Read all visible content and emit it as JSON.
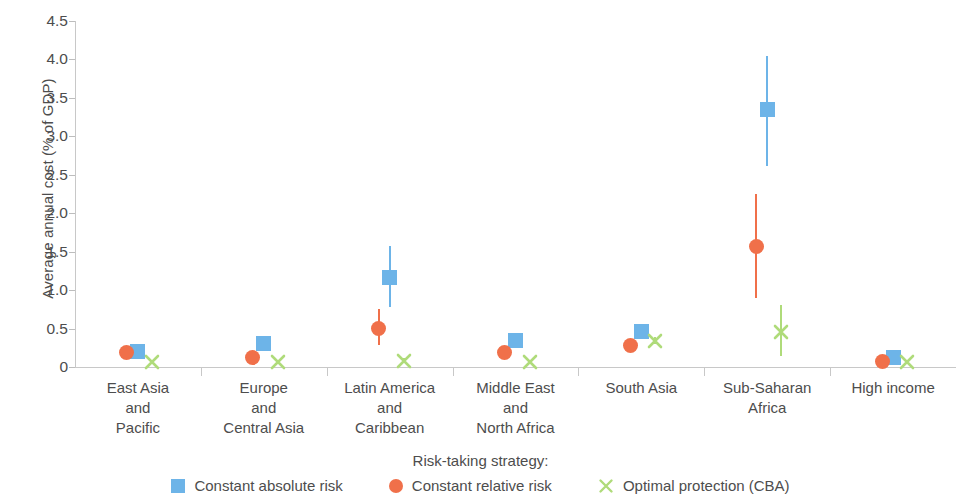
{
  "chart_data": {
    "type": "scatter",
    "title": "",
    "xlabel": "",
    "ylabel": "Average annual cost (% of GDP)",
    "ylim": [
      0,
      4.5
    ],
    "yticks": [
      0,
      0.5,
      1.0,
      1.5,
      2.0,
      2.5,
      3.0,
      3.5,
      4.0,
      4.5
    ],
    "ytick_labels": [
      "0",
      "0.5",
      "1.0",
      "1.5",
      "2.0",
      "2.5",
      "3.0",
      "3.5",
      "4.0",
      "4.5"
    ],
    "grid": false,
    "legend_position": "bottom",
    "legend_title": "Risk-taking strategy:",
    "categories": [
      "East Asia\nand\nPacific",
      "Europe\nand\nCentral Asia",
      "Latin America\nand\nCaribbean",
      "Middle East\nand\nNorth Africa",
      "South Asia",
      "Sub-Saharan\nAfrica",
      "High income"
    ],
    "series": [
      {
        "name": "Constant absolute risk",
        "marker": "square",
        "color": "#6DB4E8",
        "values": [
          0.2,
          0.3,
          1.17,
          0.35,
          0.46,
          3.35,
          0.13
        ],
        "low": [
          0.18,
          0.26,
          0.78,
          0.28,
          0.4,
          2.62,
          0.1
        ],
        "high": [
          0.23,
          0.34,
          1.58,
          0.44,
          0.53,
          4.05,
          0.17
        ]
      },
      {
        "name": "Constant relative risk",
        "marker": "circle",
        "color": "#F0704A",
        "values": [
          0.19,
          0.13,
          0.5,
          0.19,
          0.28,
          1.57,
          0.07
        ],
        "low": [
          0.17,
          0.11,
          0.28,
          0.16,
          0.24,
          0.9,
          0.05
        ],
        "high": [
          0.21,
          0.16,
          0.76,
          0.23,
          0.33,
          2.25,
          0.09
        ]
      },
      {
        "name": "Optimal protection (CBA)",
        "marker": "x",
        "color": "#AFDB7A",
        "values": [
          0.06,
          0.06,
          0.08,
          0.07,
          0.34,
          0.46,
          0.07
        ],
        "low": [
          0.04,
          0.04,
          0.05,
          0.05,
          0.3,
          0.14,
          0.05
        ],
        "high": [
          0.09,
          0.09,
          0.12,
          0.1,
          0.39,
          0.8,
          0.09
        ]
      }
    ]
  },
  "axes": {
    "y_axis_label": "Average annual cost (% of GDP)"
  },
  "legend": {
    "title": "Risk-taking strategy:",
    "items": [
      {
        "label": "Constant absolute risk",
        "marker": "square",
        "color": "#6DB4E8"
      },
      {
        "label": "Constant relative risk",
        "marker": "circle",
        "color": "#F0704A"
      },
      {
        "label": "Optimal protection (CBA)",
        "marker": "x",
        "color": "#AFDB7A"
      }
    ]
  },
  "colors": {
    "blue": "#6DB4E8",
    "orange": "#F0704A",
    "green": "#AFDB7A",
    "axis": "#c8c8c8",
    "text": "#4d4d4d"
  }
}
